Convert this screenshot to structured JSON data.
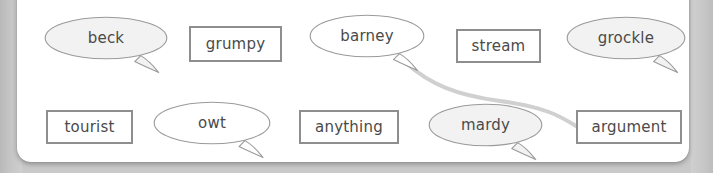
{
  "canvas": {
    "width": 713,
    "height": 173,
    "background_color": "#c9c9c9",
    "card_color": "#ffffff"
  },
  "theme": {
    "outline_color": "#8e8e8e",
    "bubble_outline_color": "#9a9a9a",
    "bubble_fill_plain": "#ffffff",
    "bubble_fill_tinted": "#f2f2f2",
    "text_color": "#4a4a4a",
    "connector_color": "#d0d0d0"
  },
  "tiles": [
    {
      "id": "beck",
      "label": "beck",
      "shape": "bubble",
      "fill": "tinted",
      "x": 44,
      "y": 16,
      "w": 124,
      "h": 44,
      "tail": "right"
    },
    {
      "id": "grumpy",
      "label": "grumpy",
      "shape": "rect",
      "fill": "plain",
      "x": 189,
      "y": 26,
      "w": 93,
      "h": 36
    },
    {
      "id": "barney",
      "label": "barney",
      "shape": "bubble",
      "fill": "plain",
      "x": 309,
      "y": 14,
      "w": 116,
      "h": 44,
      "tail": "right"
    },
    {
      "id": "stream",
      "label": "stream",
      "shape": "rect",
      "fill": "plain",
      "x": 456,
      "y": 29,
      "w": 85,
      "h": 34
    },
    {
      "id": "grockle",
      "label": "grockle",
      "shape": "bubble",
      "fill": "tinted",
      "x": 566,
      "y": 16,
      "w": 120,
      "h": 44,
      "tail": "right"
    },
    {
      "id": "tourist",
      "label": "tourist",
      "shape": "rect",
      "fill": "plain",
      "x": 46,
      "y": 110,
      "w": 87,
      "h": 34
    },
    {
      "id": "owt",
      "label": "owt",
      "shape": "bubble",
      "fill": "plain",
      "x": 153,
      "y": 101,
      "w": 118,
      "h": 44,
      "tail": "right"
    },
    {
      "id": "anything",
      "label": "anything",
      "shape": "rect",
      "fill": "plain",
      "x": 299,
      "y": 110,
      "w": 100,
      "h": 34
    },
    {
      "id": "mardy",
      "label": "mardy",
      "shape": "bubble",
      "fill": "tinted",
      "x": 428,
      "y": 103,
      "w": 115,
      "h": 44,
      "tail": "right"
    },
    {
      "id": "argument",
      "label": "argument",
      "shape": "rect",
      "fill": "plain",
      "x": 576,
      "y": 110,
      "w": 106,
      "h": 34
    }
  ],
  "connectors": [
    {
      "id": "barney-to-argument",
      "from": "barney",
      "to": "argument",
      "color": "#d0d0d0",
      "width": 4,
      "path": "M 406 63 C 430 84, 455 95, 500 101 C 545 107, 560 116, 576 126"
    }
  ]
}
